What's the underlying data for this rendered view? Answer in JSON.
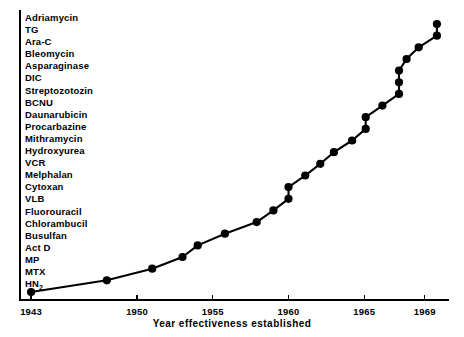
{
  "chart_data": {
    "type": "line",
    "title": "",
    "subtitle": "",
    "xlabel": "Year effectiveness established",
    "ylabel": "",
    "xlim": [
      1942.2,
      1970.6
    ],
    "ylim": [
      0,
      25
    ],
    "grid": false,
    "legend": null,
    "x_ticks": [
      "1943",
      "1950",
      "1955",
      "1960",
      "1965",
      "1969"
    ],
    "x_tick_values": [
      1943,
      1950,
      1955,
      1960,
      1965,
      1969
    ],
    "y_tick_labels": [
      "Adriamycin",
      "TG",
      "Ara-C",
      "Bleomycin",
      "Asparaginase",
      "DIC",
      "Streptozotozin",
      "BCNU",
      "Daunarubicin",
      "Procarbazine",
      "Mithramycin",
      "Hydroxyurea",
      "VCR",
      "Melphalan",
      "Cytoxan",
      "VLB",
      "Fluorouracil",
      "Chlorambucil",
      "Busulfan",
      "Act D",
      "MP",
      "MTX",
      "HN2"
    ],
    "series": [
      {
        "name": "Cumulative anticancer drugs",
        "points": [
          {
            "drug": "HN2",
            "x": 1943,
            "y": 1
          },
          {
            "drug": "MTX",
            "x": 1948,
            "y": 2
          },
          {
            "drug": "MP",
            "x": 1951,
            "y": 3
          },
          {
            "drug": "Act D",
            "x": 1953,
            "y": 4
          },
          {
            "drug": "Busulfan",
            "x": 1954,
            "y": 5
          },
          {
            "drug": "Chlorambucil",
            "x": 1955.8,
            "y": 6
          },
          {
            "drug": "Fluorouracil",
            "x": 1957.9,
            "y": 7
          },
          {
            "drug": "VLB",
            "x": 1959,
            "y": 8
          },
          {
            "drug": "Cytoxan",
            "x": 1960,
            "y": 9
          },
          {
            "drug": "Melphalan",
            "x": 1960,
            "y": 10
          },
          {
            "drug": "VCR",
            "x": 1961.1,
            "y": 11
          },
          {
            "drug": "Hydroxyurea",
            "x": 1962.1,
            "y": 12
          },
          {
            "drug": "Mithramycin",
            "x": 1963,
            "y": 13
          },
          {
            "drug": "Procarbazine",
            "x": 1964.2,
            "y": 14
          },
          {
            "drug": "Daunarubicin",
            "x": 1965.1,
            "y": 15
          },
          {
            "drug": "BCNU",
            "x": 1965.1,
            "y": 16
          },
          {
            "drug": "Streptozotozin",
            "x": 1966.2,
            "y": 17
          },
          {
            "drug": "DIC",
            "x": 1967.3,
            "y": 18
          },
          {
            "drug": "Asparaginase",
            "x": 1967.3,
            "y": 19
          },
          {
            "drug": "Bleomycin",
            "x": 1967.3,
            "y": 20
          },
          {
            "drug": "Ara-C",
            "x": 1967.8,
            "y": 21
          },
          {
            "drug": "Procarbazine2",
            "x": 1968.6,
            "y": 22
          },
          {
            "drug": "TG",
            "x": 1969.8,
            "y": 23
          },
          {
            "drug": "Adriamycin",
            "x": 1969.8,
            "y": 24
          }
        ]
      }
    ]
  },
  "colors": {
    "ink": "#000000",
    "background": "#ffffff"
  }
}
